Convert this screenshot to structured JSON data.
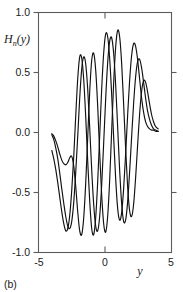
{
  "figure": {
    "caption": "(b)"
  },
  "chart_data": {
    "type": "line",
    "title": "",
    "xlabel": "y",
    "ylabel": "H",
    "ylabel_sub": "n",
    "ylabel_arg": "(y)",
    "ylabel_full": "H_n(y)",
    "xlim": [
      -5,
      5
    ],
    "ylim": [
      -1.0,
      1.0
    ],
    "grid": false,
    "legend": "none",
    "xticks": [
      -5,
      0,
      5
    ],
    "xtick_labels": [
      "-5",
      "0",
      "5"
    ],
    "yticks": [
      -1.0,
      -0.5,
      0.0,
      0.5,
      1.0
    ],
    "ytick_labels": [
      "-1.0",
      "-0.5",
      "0.0",
      "0.5",
      "1.0"
    ],
    "line_color": "#111111",
    "series": [
      {
        "name": "H_n(y) curve 1",
        "x": [
          -4.0,
          -3.85,
          -3.7,
          -3.55,
          -3.4,
          -3.25,
          -3.1,
          -2.95,
          -2.8,
          -2.65,
          -2.5,
          -2.35,
          -2.2,
          -2.05,
          -1.9,
          -1.75,
          -1.6,
          -1.45,
          -1.3,
          -1.15,
          -1.0,
          -0.85,
          -0.7,
          -0.55,
          -0.4,
          -0.25,
          -0.1,
          0.05,
          0.2,
          0.35,
          0.5,
          0.65,
          0.8,
          0.95,
          1.1,
          1.25,
          1.4,
          1.55,
          1.7,
          1.85,
          2.0,
          2.15,
          2.3,
          2.45,
          2.6,
          2.75,
          2.9,
          3.05,
          3.2,
          3.35,
          3.5,
          3.65,
          3.8,
          4.0
        ],
        "y": [
          -0.02,
          -0.06,
          -0.13,
          -0.22,
          -0.34,
          -0.47,
          -0.59,
          -0.7,
          -0.78,
          -0.8,
          -0.74,
          -0.58,
          -0.33,
          -0.03,
          0.29,
          0.53,
          0.63,
          0.57,
          0.36,
          0.04,
          -0.31,
          -0.6,
          -0.78,
          -0.82,
          -0.7,
          -0.44,
          -0.09,
          0.28,
          0.58,
          0.76,
          0.79,
          0.66,
          0.4,
          0.05,
          -0.31,
          -0.59,
          -0.74,
          -0.73,
          -0.58,
          -0.33,
          -0.04,
          0.24,
          0.46,
          0.59,
          0.61,
          0.54,
          0.42,
          0.29,
          0.18,
          0.11,
          0.06,
          0.03,
          0.02,
          0.01
        ]
      },
      {
        "name": "H_n(y) curve 2",
        "x": [
          -4.0,
          -3.85,
          -3.7,
          -3.55,
          -3.4,
          -3.25,
          -3.1,
          -2.95,
          -2.8,
          -2.65,
          -2.5,
          -2.35,
          -2.2,
          -2.05,
          -1.9,
          -1.75,
          -1.6,
          -1.45,
          -1.3,
          -1.15,
          -1.0,
          -0.85,
          -0.7,
          -0.55,
          -0.4,
          -0.25,
          -0.1,
          0.05,
          0.2,
          0.35,
          0.5,
          0.65,
          0.8,
          0.95,
          1.1,
          1.25,
          1.4,
          1.55,
          1.7,
          1.85,
          2.0,
          2.15,
          2.3,
          2.45,
          2.6,
          2.75,
          2.9,
          3.05,
          3.2,
          3.35,
          3.5,
          3.65,
          3.8,
          4.0
        ],
        "y": [
          -0.15,
          -0.22,
          -0.31,
          -0.42,
          -0.54,
          -0.66,
          -0.76,
          -0.82,
          -0.8,
          -0.69,
          -0.48,
          -0.2,
          0.14,
          0.45,
          0.63,
          0.62,
          0.44,
          0.13,
          -0.24,
          -0.57,
          -0.8,
          -0.85,
          -0.71,
          -0.41,
          -0.03,
          0.36,
          0.66,
          0.82,
          0.8,
          0.62,
          0.32,
          -0.04,
          -0.38,
          -0.63,
          -0.73,
          -0.67,
          -0.47,
          -0.18,
          0.14,
          0.43,
          0.64,
          0.74,
          0.72,
          0.61,
          0.45,
          0.29,
          0.17,
          0.09,
          0.05,
          0.03,
          0.02,
          0.02,
          0.01,
          0.01
        ]
      },
      {
        "name": "H_n(y) curve 3",
        "x": [
          -4.0,
          -3.85,
          -3.7,
          -3.55,
          -3.4,
          -3.25,
          -3.1,
          -2.95,
          -2.8,
          -2.65,
          -2.5,
          -2.35,
          -2.2,
          -2.05,
          -1.9,
          -1.75,
          -1.6,
          -1.45,
          -1.3,
          -1.15,
          -1.0,
          -0.85,
          -0.7,
          -0.55,
          -0.4,
          -0.25,
          -0.1,
          0.05,
          0.2,
          0.35,
          0.5,
          0.65,
          0.8,
          0.95,
          1.1,
          1.25,
          1.4,
          1.55,
          1.7,
          1.85,
          2.0,
          2.15,
          2.3,
          2.45,
          2.6,
          2.75,
          2.9,
          3.05,
          3.2,
          3.35,
          3.5,
          3.65,
          3.8,
          4.0
        ],
        "y": [
          -0.01,
          -0.03,
          -0.07,
          -0.12,
          -0.18,
          -0.23,
          -0.26,
          -0.27,
          -0.25,
          -0.21,
          -0.2,
          -0.28,
          -0.45,
          -0.66,
          -0.82,
          -0.85,
          -0.71,
          -0.42,
          -0.04,
          0.34,
          0.6,
          0.66,
          0.52,
          0.22,
          -0.17,
          -0.52,
          -0.76,
          -0.83,
          -0.7,
          -0.4,
          0.01,
          0.41,
          0.71,
          0.85,
          0.8,
          0.58,
          0.24,
          -0.13,
          -0.45,
          -0.65,
          -0.7,
          -0.6,
          -0.38,
          -0.11,
          0.15,
          0.34,
          0.43,
          0.42,
          0.34,
          0.24,
          0.15,
          0.09,
          0.05,
          0.03
        ]
      }
    ]
  }
}
